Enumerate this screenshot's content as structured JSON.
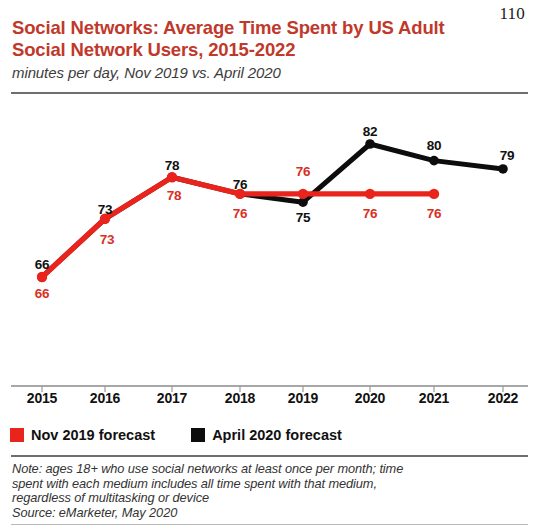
{
  "page_number": "110",
  "header": {
    "title": "Social Networks: Average Time Spent by US Adult Social Network Users, 2015-2022",
    "subtitle": "minutes per day, Nov 2019 vs. April 2020"
  },
  "legend": {
    "items": [
      {
        "label": "Nov 2019 forecast",
        "color": "#e8241c",
        "swatch": "red"
      },
      {
        "label": "April 2020 forecast",
        "color": "#0d0d0d",
        "swatch": "black"
      }
    ]
  },
  "footnote": {
    "note_line1": "Note: ages 18+ who use social networks at least once per month; time",
    "note_line2": "spent with each medium includes all time spent with that medium,",
    "note_line3": "regardless of multitasking or device",
    "source": "Source: eMarketer, May 2020"
  },
  "chart_data": {
    "type": "line",
    "title": "Social Networks: Average Time Spent by US Adult Social Network Users, 2015-2022",
    "subtitle": "minutes per day, Nov 2019 vs. April 2020",
    "xlabel": "",
    "ylabel": "minutes per day",
    "categories": [
      "2015",
      "2016",
      "2017",
      "2018",
      "2019",
      "2020",
      "2021",
      "2022"
    ],
    "ylim": [
      60,
      86
    ],
    "grid": false,
    "legend_position": "bottom-left",
    "series": [
      {
        "name": "Nov 2019 forecast",
        "color": "#e8241c",
        "values": [
          66,
          73,
          78,
          76,
          76,
          76,
          76,
          null
        ],
        "labels": [
          "66",
          "73",
          "78",
          "76",
          "76",
          "76",
          "76",
          ""
        ]
      },
      {
        "name": "April 2020 forecast",
        "color": "#0d0d0d",
        "values": [
          66,
          73,
          78,
          76,
          75,
          82,
          80,
          79
        ],
        "labels": [
          "66",
          "73",
          "78",
          "76",
          "75",
          "82",
          "80",
          "79"
        ]
      }
    ],
    "point_labels": [
      {
        "series": "April 2020 forecast",
        "category": "2015",
        "text": "66",
        "color": "black",
        "x": 42,
        "y": 161
      },
      {
        "series": "April 2020 forecast",
        "category": "2016",
        "text": "73",
        "color": "black",
        "x": 105,
        "y": 106
      },
      {
        "series": "April 2020 forecast",
        "category": "2017",
        "text": "78",
        "color": "black",
        "x": 172,
        "y": 62
      },
      {
        "series": "April 2020 forecast",
        "category": "2018",
        "text": "76",
        "color": "black",
        "x": 240,
        "y": 81
      },
      {
        "series": "April 2020 forecast",
        "category": "2019",
        "text": "75",
        "color": "black",
        "x": 303,
        "y": 114
      },
      {
        "series": "April 2020 forecast",
        "category": "2020",
        "text": "82",
        "color": "black",
        "x": 370,
        "y": 28
      },
      {
        "series": "April 2020 forecast",
        "category": "2021",
        "text": "80",
        "color": "black",
        "x": 434,
        "y": 42
      },
      {
        "series": "April 2020 forecast",
        "category": "2022",
        "text": "79",
        "color": "black",
        "x": 507,
        "y": 52
      },
      {
        "series": "Nov 2019 forecast",
        "category": "2015",
        "text": "66",
        "color": "red",
        "x": 42,
        "y": 190
      },
      {
        "series": "Nov 2019 forecast",
        "category": "2016",
        "text": "73",
        "color": "red",
        "x": 107,
        "y": 136
      },
      {
        "series": "Nov 2019 forecast",
        "category": "2017",
        "text": "78",
        "color": "red",
        "x": 174,
        "y": 92
      },
      {
        "series": "Nov 2019 forecast",
        "category": "2018",
        "text": "76",
        "color": "red",
        "x": 240,
        "y": 110
      },
      {
        "series": "Nov 2019 forecast",
        "category": "2019",
        "text": "76",
        "color": "red",
        "x": 303,
        "y": 68
      },
      {
        "series": "Nov 2019 forecast",
        "category": "2020",
        "text": "76",
        "color": "red",
        "x": 370,
        "y": 110
      },
      {
        "series": "Nov 2019 forecast",
        "category": "2021",
        "text": "76",
        "color": "red",
        "x": 434,
        "y": 110
      }
    ],
    "axis_ticks": [
      {
        "label": "2015",
        "x": 42
      },
      {
        "label": "2016",
        "x": 105
      },
      {
        "label": "2017",
        "x": 172
      },
      {
        "label": "2018",
        "x": 240
      },
      {
        "label": "2019",
        "x": 303
      },
      {
        "label": "2020",
        "x": 370
      },
      {
        "label": "2021",
        "x": 434
      },
      {
        "label": "2022",
        "x": 503
      }
    ]
  }
}
